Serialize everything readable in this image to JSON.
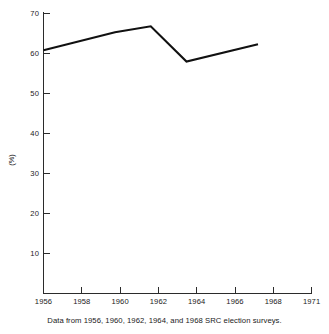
{
  "chart_data": {
    "type": "line",
    "title": "",
    "subtitle": "",
    "xlabel": "",
    "ylabel": "(%)",
    "x": [
      1956,
      1960,
      1962,
      1964,
      1968
    ],
    "values": [
      60.8,
      65.3,
      66.8,
      58.0,
      62.3
    ],
    "series": [
      {
        "name": "",
        "x": [
          1956,
          1960,
          1962,
          1964,
          1968
        ],
        "values": [
          60.8,
          65.3,
          66.8,
          58.0,
          62.3
        ]
      }
    ],
    "xlim": [
      1956,
      1971
    ],
    "ylim": [
      0,
      73
    ],
    "x_tick_labels": [
      "1956",
      "1958",
      "1960",
      "1962",
      "1964",
      "1966",
      "1968",
      "1971"
    ],
    "x_tick_values": [
      1956,
      1958,
      1960,
      1962,
      1964,
      1966,
      1968,
      1971
    ],
    "y_tick_labels": [
      "10",
      "20",
      "30",
      "40",
      "50",
      "60",
      "70"
    ],
    "y_tick_values": [
      10,
      20,
      30,
      40,
      50,
      60,
      70
    ],
    "grid": false,
    "legend": "none",
    "line_color": "#111111",
    "axis_color": "#2b2b2b",
    "background_color": "#ffffff",
    "annotations": []
  },
  "caption": {
    "text": "Data from 1956, 1960, 1962, 1964, and 1968 SRC election surveys."
  }
}
